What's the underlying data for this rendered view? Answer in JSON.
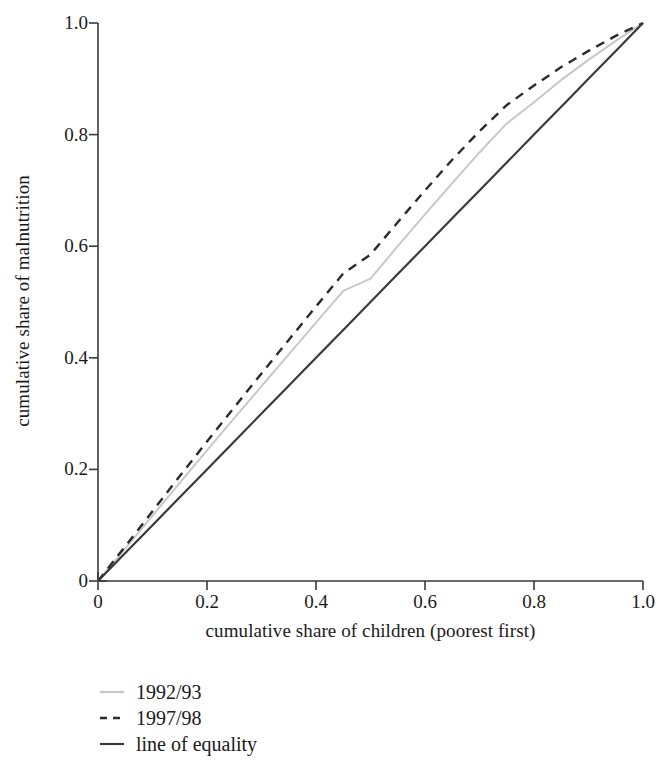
{
  "chart_data": {
    "type": "line",
    "title": "",
    "xlabel": "cumulative share of children (poorest first)",
    "ylabel": "cumulative share of malnutrition",
    "xlim": [
      0,
      1.0
    ],
    "ylim": [
      0,
      1.0
    ],
    "grid": false,
    "legend_position": "below-left",
    "xticks": [
      "0",
      "0.2",
      "0.4",
      "0.6",
      "0.8",
      "1.0"
    ],
    "xtick_values": [
      0,
      0.2,
      0.4,
      0.6,
      0.8,
      1.0
    ],
    "yticks": [
      "0",
      "0.2",
      "0.4",
      "0.6",
      "0.8",
      "1.0"
    ],
    "ytick_values": [
      0,
      0.2,
      0.4,
      0.6,
      0.8,
      1.0
    ],
    "x": [
      0,
      0.05,
      0.1,
      0.15,
      0.2,
      0.25,
      0.3,
      0.35,
      0.4,
      0.45,
      0.5,
      0.55,
      0.6,
      0.65,
      0.7,
      0.75,
      0.8,
      0.85,
      0.9,
      0.95,
      1.0
    ],
    "series": [
      {
        "name": "1992/93",
        "style": "solid",
        "color": "#c8c8c8",
        "values": [
          0,
          0.058,
          0.117,
          0.176,
          0.234,
          0.292,
          0.349,
          0.406,
          0.463,
          0.52,
          0.542,
          0.6,
          0.657,
          0.713,
          0.768,
          0.82,
          0.858,
          0.898,
          0.934,
          0.968,
          1.0
        ]
      },
      {
        "name": "1997/98",
        "style": "dashed",
        "color": "#2b2b2b",
        "values": [
          0,
          0.062,
          0.125,
          0.188,
          0.25,
          0.311,
          0.372,
          0.432,
          0.492,
          0.551,
          0.585,
          0.643,
          0.7,
          0.755,
          0.806,
          0.853,
          0.888,
          0.921,
          0.95,
          0.977,
          1.0
        ]
      },
      {
        "name": "line of equality",
        "style": "solid",
        "color": "#3a3a3a",
        "values": [
          0,
          0.05,
          0.1,
          0.15,
          0.2,
          0.25,
          0.3,
          0.35,
          0.4,
          0.45,
          0.5,
          0.55,
          0.6,
          0.65,
          0.7,
          0.75,
          0.8,
          0.85,
          0.9,
          0.95,
          1.0
        ]
      }
    ]
  },
  "legend": {
    "entries": [
      {
        "label": "1992/93"
      },
      {
        "label": "1997/98"
      },
      {
        "label": "line of equality"
      }
    ]
  }
}
